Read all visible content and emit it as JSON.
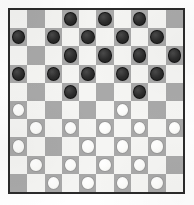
{
  "board": {
    "title": "Draughts Board",
    "variant": "International Draughts",
    "rows": 10,
    "columns": 10,
    "light_square_color": "#f5f5f3",
    "dark_square_color": "#a9a9a9",
    "black_piece_color": "#2c2c2c",
    "white_piece_color": "#fbfbf9",
    "border_color": "#2b2b2b",
    "piece_counts": {
      "black": 19,
      "white": 19
    },
    "cells": [
      [
        {
          "shade": "light",
          "piece": null
        },
        {
          "shade": "dark",
          "piece": null
        },
        {
          "shade": "light",
          "piece": null
        },
        {
          "shade": "dark",
          "piece": "black"
        },
        {
          "shade": "light",
          "piece": null
        },
        {
          "shade": "dark",
          "piece": "black"
        },
        {
          "shade": "light",
          "piece": null
        },
        {
          "shade": "dark",
          "piece": "black"
        },
        {
          "shade": "light",
          "piece": null
        },
        {
          "shade": "dark",
          "piece": null
        }
      ],
      [
        {
          "shade": "dark",
          "piece": "black"
        },
        {
          "shade": "light",
          "piece": null
        },
        {
          "shade": "dark",
          "piece": "black"
        },
        {
          "shade": "light",
          "piece": null
        },
        {
          "shade": "dark",
          "piece": "black"
        },
        {
          "shade": "light",
          "piece": null
        },
        {
          "shade": "dark",
          "piece": "black"
        },
        {
          "shade": "light",
          "piece": null
        },
        {
          "shade": "dark",
          "piece": "black"
        },
        {
          "shade": "light",
          "piece": null
        }
      ],
      [
        {
          "shade": "light",
          "piece": null
        },
        {
          "shade": "dark",
          "piece": null
        },
        {
          "shade": "light",
          "piece": null
        },
        {
          "shade": "dark",
          "piece": "black"
        },
        {
          "shade": "light",
          "piece": null
        },
        {
          "shade": "dark",
          "piece": "black"
        },
        {
          "shade": "light",
          "piece": null
        },
        {
          "shade": "dark",
          "piece": "black"
        },
        {
          "shade": "light",
          "piece": null
        },
        {
          "shade": "dark",
          "piece": "black"
        }
      ],
      [
        {
          "shade": "dark",
          "piece": "black"
        },
        {
          "shade": "light",
          "piece": null
        },
        {
          "shade": "dark",
          "piece": "black"
        },
        {
          "shade": "light",
          "piece": null
        },
        {
          "shade": "dark",
          "piece": "black"
        },
        {
          "shade": "light",
          "piece": null
        },
        {
          "shade": "dark",
          "piece": "black"
        },
        {
          "shade": "light",
          "piece": null
        },
        {
          "shade": "dark",
          "piece": "black"
        },
        {
          "shade": "light",
          "piece": null
        }
      ],
      [
        {
          "shade": "light",
          "piece": null
        },
        {
          "shade": "dark",
          "piece": null
        },
        {
          "shade": "light",
          "piece": null
        },
        {
          "shade": "dark",
          "piece": "black"
        },
        {
          "shade": "light",
          "piece": null
        },
        {
          "shade": "dark",
          "piece": null
        },
        {
          "shade": "light",
          "piece": null
        },
        {
          "shade": "dark",
          "piece": "black"
        },
        {
          "shade": "light",
          "piece": null
        },
        {
          "shade": "dark",
          "piece": null
        }
      ],
      [
        {
          "shade": "dark",
          "piece": "white"
        },
        {
          "shade": "light",
          "piece": null
        },
        {
          "shade": "dark",
          "piece": null
        },
        {
          "shade": "light",
          "piece": null
        },
        {
          "shade": "dark",
          "piece": null
        },
        {
          "shade": "light",
          "piece": null
        },
        {
          "shade": "dark",
          "piece": "white"
        },
        {
          "shade": "light",
          "piece": null
        },
        {
          "shade": "dark",
          "piece": null
        },
        {
          "shade": "light",
          "piece": null
        }
      ],
      [
        {
          "shade": "light",
          "piece": null
        },
        {
          "shade": "dark",
          "piece": "white"
        },
        {
          "shade": "light",
          "piece": null
        },
        {
          "shade": "dark",
          "piece": "white"
        },
        {
          "shade": "light",
          "piece": null
        },
        {
          "shade": "dark",
          "piece": "white"
        },
        {
          "shade": "light",
          "piece": null
        },
        {
          "shade": "dark",
          "piece": "white"
        },
        {
          "shade": "light",
          "piece": null
        },
        {
          "shade": "dark",
          "piece": "white"
        }
      ],
      [
        {
          "shade": "dark",
          "piece": "white"
        },
        {
          "shade": "light",
          "piece": null
        },
        {
          "shade": "dark",
          "piece": null
        },
        {
          "shade": "light",
          "piece": null
        },
        {
          "shade": "dark",
          "piece": "white"
        },
        {
          "shade": "light",
          "piece": null
        },
        {
          "shade": "dark",
          "piece": "white"
        },
        {
          "shade": "light",
          "piece": null
        },
        {
          "shade": "dark",
          "piece": "white"
        },
        {
          "shade": "light",
          "piece": null
        }
      ],
      [
        {
          "shade": "light",
          "piece": null
        },
        {
          "shade": "dark",
          "piece": "white"
        },
        {
          "shade": "light",
          "piece": null
        },
        {
          "shade": "dark",
          "piece": "white"
        },
        {
          "shade": "light",
          "piece": null
        },
        {
          "shade": "dark",
          "piece": "white"
        },
        {
          "shade": "light",
          "piece": null
        },
        {
          "shade": "dark",
          "piece": "white"
        },
        {
          "shade": "light",
          "piece": null
        },
        {
          "shade": "dark",
          "piece": null
        }
      ],
      [
        {
          "shade": "dark",
          "piece": null
        },
        {
          "shade": "light",
          "piece": null
        },
        {
          "shade": "dark",
          "piece": "white"
        },
        {
          "shade": "light",
          "piece": null
        },
        {
          "shade": "dark",
          "piece": "white"
        },
        {
          "shade": "light",
          "piece": null
        },
        {
          "shade": "dark",
          "piece": "white"
        },
        {
          "shade": "light",
          "piece": null
        },
        {
          "shade": "dark",
          "piece": "white"
        },
        {
          "shade": "light",
          "piece": null
        }
      ]
    ]
  }
}
